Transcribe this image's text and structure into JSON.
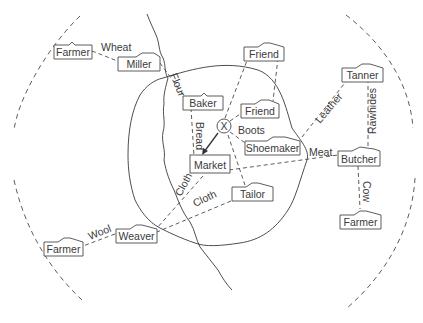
{
  "nodes": [
    {
      "id": "farmer-wheat",
      "label": "Farmer"
    },
    {
      "id": "miller",
      "label": "Miller"
    },
    {
      "id": "baker",
      "label": "Baker"
    },
    {
      "id": "friend-top",
      "label": "Friend"
    },
    {
      "id": "friend-inner",
      "label": "Friend"
    },
    {
      "id": "tanner",
      "label": "Tanner"
    },
    {
      "id": "shoemaker",
      "label": "Shoemaker"
    },
    {
      "id": "market",
      "label": "Market"
    },
    {
      "id": "butcher",
      "label": "Butcher"
    },
    {
      "id": "tailor",
      "label": "Tailor"
    },
    {
      "id": "farmer-cow",
      "label": "Farmer"
    },
    {
      "id": "weaver",
      "label": "Weaver"
    },
    {
      "id": "farmer-wool",
      "label": "Farmer"
    }
  ],
  "person": {
    "label": "X"
  },
  "flows": [
    {
      "id": "wheat",
      "label": "Wheat"
    },
    {
      "id": "flour",
      "label": "Flour"
    },
    {
      "id": "bread",
      "label": "Bread"
    },
    {
      "id": "boots",
      "label": "Boots"
    },
    {
      "id": "leather",
      "label": "Leather"
    },
    {
      "id": "rawhides",
      "label": "Rawhides"
    },
    {
      "id": "meat",
      "label": "Meat"
    },
    {
      "id": "cow",
      "label": "Cow"
    },
    {
      "id": "cloth-market",
      "label": "Cloth"
    },
    {
      "id": "cloth-tailor",
      "label": "Cloth"
    },
    {
      "id": "wool",
      "label": "Wool"
    }
  ]
}
